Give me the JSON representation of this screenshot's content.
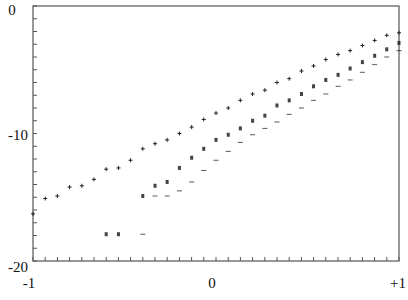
{
  "chart_data": {
    "type": "scatter",
    "title": "",
    "xlabel": "",
    "ylabel": "",
    "xlim": [
      -1,
      1
    ],
    "ylim": [
      -20,
      0
    ],
    "grid": false,
    "legend": null,
    "x_tick_labels": [
      {
        "value": -1,
        "label": "-1"
      },
      {
        "value": 0,
        "label": "0"
      },
      {
        "value": 1,
        "label": "+1"
      }
    ],
    "y_tick_labels": [
      {
        "value": 0,
        "label": "0"
      },
      {
        "value": -10,
        "label": "-10"
      },
      {
        "value": -20,
        "label": "-20"
      }
    ],
    "x_minor_ticks": 30,
    "y_minor_ticks": 20,
    "series": [
      {
        "name": "upper",
        "marker": "+",
        "points": [
          [
            -1.0,
            -16.3
          ],
          [
            -0.933,
            -15.1
          ],
          [
            -0.867,
            -14.9
          ],
          [
            -0.8,
            -14.2
          ],
          [
            -0.733,
            -14.1
          ],
          [
            -0.667,
            -13.6
          ],
          [
            -0.6,
            -12.8
          ],
          [
            -0.533,
            -12.7
          ],
          [
            -0.467,
            -12.1
          ],
          [
            -0.4,
            -11.2
          ],
          [
            -0.333,
            -10.8
          ],
          [
            -0.267,
            -10.5
          ],
          [
            -0.2,
            -10.0
          ],
          [
            -0.133,
            -9.5
          ],
          [
            -0.067,
            -8.9
          ],
          [
            0.0,
            -8.4
          ],
          [
            0.067,
            -8.0
          ],
          [
            0.133,
            -7.4
          ],
          [
            0.2,
            -6.9
          ],
          [
            0.267,
            -6.6
          ],
          [
            0.333,
            -6.0
          ],
          [
            0.4,
            -5.7
          ],
          [
            0.467,
            -5.1
          ],
          [
            0.533,
            -4.7
          ],
          [
            0.6,
            -4.2
          ],
          [
            0.667,
            -3.8
          ],
          [
            0.733,
            -3.5
          ],
          [
            0.8,
            -3.1
          ],
          [
            0.867,
            -2.7
          ],
          [
            0.933,
            -2.3
          ],
          [
            1.0,
            -2.1
          ]
        ]
      },
      {
        "name": "middle",
        "marker": "x",
        "points": [
          [
            -0.6,
            -17.9
          ],
          [
            -0.533,
            -17.9
          ],
          [
            -0.4,
            -14.9
          ],
          [
            -0.333,
            -14.1
          ],
          [
            -0.267,
            -13.8
          ],
          [
            -0.2,
            -12.7
          ],
          [
            -0.133,
            -11.9
          ],
          [
            -0.067,
            -11.2
          ],
          [
            0.0,
            -10.5
          ],
          [
            0.067,
            -10.1
          ],
          [
            0.133,
            -9.6
          ],
          [
            0.2,
            -9.0
          ],
          [
            0.267,
            -8.6
          ],
          [
            0.333,
            -7.8
          ],
          [
            0.4,
            -7.4
          ],
          [
            0.467,
            -6.9
          ],
          [
            0.533,
            -6.3
          ],
          [
            0.6,
            -5.8
          ],
          [
            0.667,
            -5.4
          ],
          [
            0.733,
            -4.9
          ],
          [
            0.8,
            -4.4
          ],
          [
            0.867,
            -3.9
          ],
          [
            0.933,
            -3.4
          ],
          [
            1.0,
            -2.9
          ]
        ]
      },
      {
        "name": "lower",
        "marker": "-",
        "points": [
          [
            -0.4,
            -17.9
          ],
          [
            -0.333,
            -14.9
          ],
          [
            -0.267,
            -14.9
          ],
          [
            -0.2,
            -14.5
          ],
          [
            -0.133,
            -13.8
          ],
          [
            -0.067,
            -12.9
          ],
          [
            0.0,
            -12.1
          ],
          [
            0.067,
            -11.4
          ],
          [
            0.133,
            -10.7
          ],
          [
            0.2,
            -10.1
          ],
          [
            0.267,
            -9.6
          ],
          [
            0.333,
            -9.1
          ],
          [
            0.4,
            -8.5
          ],
          [
            0.467,
            -8.0
          ],
          [
            0.533,
            -7.4
          ],
          [
            0.6,
            -6.9
          ],
          [
            0.667,
            -6.3
          ],
          [
            0.733,
            -5.8
          ],
          [
            0.8,
            -5.2
          ],
          [
            0.867,
            -4.6
          ],
          [
            0.933,
            -4.0
          ],
          [
            1.0,
            -3.5
          ]
        ]
      }
    ]
  },
  "style": {
    "axis_color": "#555555",
    "marker_color": "#222222",
    "background": "#ffffff"
  }
}
